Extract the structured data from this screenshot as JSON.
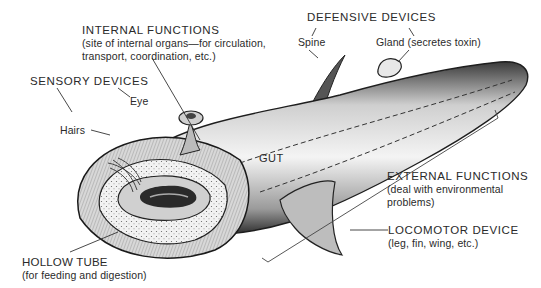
{
  "diagram": {
    "labels": {
      "internal_functions": {
        "title": "INTERNAL FUNCTIONS",
        "line1": "(site of internal organs—for circulation,",
        "line2": "transport, coordination, etc.)"
      },
      "defensive_devices": {
        "title": "DEFENSIVE DEVICES",
        "spine": "Spine",
        "gland": "Gland (secretes toxin)"
      },
      "sensory_devices": {
        "title": "SENSORY DEVICES",
        "eye": "Eye",
        "hairs": "Hairs"
      },
      "gut": "GUT",
      "external_functions": {
        "title": "EXTERNAL FUNCTIONS",
        "line1": "(deal with environmental",
        "line2": "problems)"
      },
      "locomotor_device": {
        "title": "LOCOMOTOR DEVICE",
        "line1": "(leg, fin, wing, etc.)"
      },
      "hollow_tube": {
        "title": "HOLLOW TUBE",
        "line1": "(for feeding and digestion)"
      }
    }
  }
}
